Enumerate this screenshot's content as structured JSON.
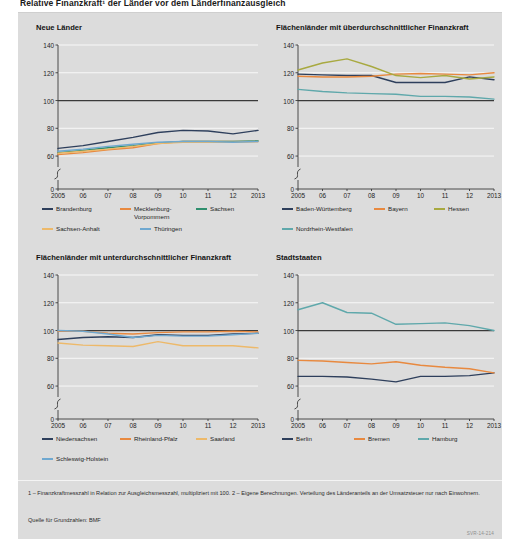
{
  "title": "Relative Finanzkraft¹ der Länder vor dem Länderfinanzausgleich",
  "footnotes": {
    "line1": "1 – Finanzkraftmesszahl in Relation zur Ausgleichsmesszahl, multipliziert mit 100.  2 – Eigene Berechnungen. Verteilung des Länderanteils an der Umsatzsteuer nur nach Einwohnern.",
    "source": "Quelle für Grundzahlen: BMF",
    "id": "SVR-14-214"
  },
  "axis": {
    "y_ticks": [
      0,
      60,
      80,
      100,
      120,
      140
    ],
    "x_ticks": [
      "2005",
      "06",
      "07",
      "08",
      "09",
      "10",
      "11",
      "12",
      "2013"
    ],
    "ylim": [
      55,
      140
    ],
    "reference_line": 100
  },
  "colors": {
    "navy": "#2e3f5c",
    "orange": "#e8893f",
    "green": "#2f8f6e",
    "sand": "#edb96a",
    "lightblue": "#6fa8d0",
    "olive": "#a8a940",
    "teal": "#5fa8ab",
    "steelblue": "#3c6fa8",
    "reference": "#3a3a3a",
    "panel_bg": "#dcdcdc"
  },
  "chart_data": [
    {
      "id": "neue-laender",
      "type": "line",
      "title": "Neue Länder",
      "xlabel": "",
      "ylabel": "",
      "ylim": [
        55,
        140
      ],
      "grid": true,
      "x": [
        "2005",
        "06",
        "07",
        "08",
        "09",
        "10",
        "11",
        "12",
        "2013"
      ],
      "series": [
        {
          "name": "Brandenburg",
          "color": "#2e3f5c",
          "values": [
            65.5,
            67.5,
            70.5,
            73.5,
            77.0,
            78.5,
            78.0,
            76.0,
            78.5
          ]
        },
        {
          "name": "Mecklenburg-Vorpommern",
          "color": "#e8893f",
          "values": [
            61.0,
            62.5,
            64.5,
            66.0,
            69.0,
            70.5,
            70.5,
            70.5,
            70.5
          ]
        },
        {
          "name": "Sachsen",
          "color": "#2f8f6e",
          "values": [
            62.5,
            64.0,
            66.0,
            67.5,
            69.5,
            70.5,
            70.5,
            70.5,
            71.0
          ]
        },
        {
          "name": "Sachsen-Anhalt",
          "color": "#edb96a",
          "values": [
            62.0,
            63.5,
            65.0,
            67.0,
            69.0,
            70.0,
            70.0,
            70.0,
            70.5
          ]
        },
        {
          "name": "Thüringen",
          "color": "#6fa8d0",
          "values": [
            63.5,
            65.0,
            67.0,
            68.5,
            70.0,
            70.5,
            70.5,
            70.0,
            70.5
          ]
        }
      ]
    },
    {
      "id": "ueberdurchschnittlich",
      "type": "line",
      "title": "Flächenländer mit überdurchschnittlicher Finanzkraft",
      "xlabel": "",
      "ylabel": "",
      "ylim": [
        55,
        140
      ],
      "grid": true,
      "x": [
        "2005",
        "06",
        "07",
        "08",
        "09",
        "10",
        "11",
        "12",
        "2013"
      ],
      "series": [
        {
          "name": "Baden-Württemberg",
          "color": "#2e3f5c",
          "values": [
            119.0,
            118.5,
            118.0,
            118.0,
            113.0,
            113.0,
            113.0,
            117.0,
            115.0
          ]
        },
        {
          "name": "Bayern",
          "color": "#e8893f",
          "values": [
            117.5,
            117.0,
            117.0,
            117.5,
            119.0,
            119.5,
            119.0,
            118.5,
            120.0
          ]
        },
        {
          "name": "Hessen",
          "color": "#a8a940",
          "values": [
            122.0,
            127.0,
            130.0,
            124.5,
            118.0,
            116.5,
            118.0,
            115.5,
            117.0
          ]
        },
        {
          "name": "Nordrhein-Westfalen",
          "color": "#5fa8ab",
          "values": [
            108.0,
            106.5,
            105.5,
            105.0,
            104.5,
            103.0,
            103.0,
            102.5,
            101.0
          ]
        }
      ]
    },
    {
      "id": "unterdurchschnittlich",
      "type": "line",
      "title": "Flächenländer mit unterdurchschnittlicher Finanzkraft",
      "xlabel": "",
      "ylabel": "",
      "ylim": [
        55,
        140
      ],
      "grid": true,
      "x": [
        "2005",
        "06",
        "07",
        "08",
        "09",
        "10",
        "11",
        "12",
        "2013"
      ],
      "series": [
        {
          "name": "Niedersachsen",
          "color": "#2e3f5c",
          "values": [
            93.5,
            95.0,
            95.5,
            95.0,
            97.0,
            96.5,
            96.5,
            97.5,
            98.0
          ]
        },
        {
          "name": "Rheinland-Pfalz",
          "color": "#e8893f",
          "values": [
            99.5,
            99.5,
            98.0,
            97.5,
            98.5,
            99.0,
            99.0,
            99.5,
            99.0
          ]
        },
        {
          "name": "Saarland",
          "color": "#edb96a",
          "values": [
            91.0,
            89.5,
            89.0,
            88.5,
            92.0,
            89.0,
            89.0,
            89.0,
            87.5
          ]
        },
        {
          "name": "Schleswig-Holstein",
          "color": "#6fa8d0",
          "values": [
            100.0,
            99.5,
            97.5,
            95.0,
            96.5,
            96.0,
            96.0,
            97.0,
            98.0
          ]
        }
      ]
    },
    {
      "id": "stadtstaaten",
      "type": "line",
      "title": "Stadtstaaten",
      "xlabel": "",
      "ylabel": "",
      "ylim": [
        55,
        140
      ],
      "grid": true,
      "x": [
        "2005",
        "06",
        "07",
        "08",
        "09",
        "10",
        "11",
        "12",
        "2013"
      ],
      "series": [
        {
          "name": "Berlin",
          "color": "#2e3f5c",
          "values": [
            67.0,
            67.0,
            66.5,
            65.0,
            63.0,
            67.0,
            67.0,
            67.5,
            69.5
          ]
        },
        {
          "name": "Bremen",
          "color": "#e8893f",
          "values": [
            78.5,
            78.0,
            77.0,
            76.0,
            77.5,
            75.0,
            73.5,
            72.5,
            69.5
          ]
        },
        {
          "name": "Hamburg",
          "color": "#5fa8ab",
          "values": [
            115.0,
            120.0,
            113.0,
            112.5,
            104.5,
            105.0,
            105.5,
            103.5,
            100.0
          ]
        }
      ]
    }
  ]
}
